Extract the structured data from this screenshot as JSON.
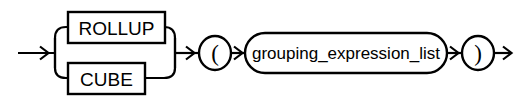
{
  "diagram": {
    "kind": "railroad-syntax-diagram",
    "background_color": "#ffffff",
    "line_color": "#000000",
    "canvas": {
      "width": 525,
      "height": 104
    },
    "entry": {
      "name": "entry-arrow",
      "label": "",
      "x1": 18,
      "y1": 53,
      "x2": 55,
      "y2": 53
    },
    "exit": {
      "name": "exit-arrow",
      "label": "",
      "x1": 492,
      "y1": 53,
      "x2": 512,
      "y2": 53
    },
    "alternation": {
      "name": "rollup-cube-choice",
      "fork_x": 55,
      "merge_x": 175,
      "corner_radius": 11,
      "branches": [
        {
          "id": "rollup",
          "label": "ROLLUP",
          "node_type": "terminal",
          "shape": "rect",
          "x": 68,
          "y": 12,
          "width": 97,
          "height": 31,
          "rail_y": 27
        },
        {
          "id": "cube",
          "label": "CUBE",
          "node_type": "terminal",
          "shape": "rect",
          "x": 68,
          "y": 63,
          "width": 77,
          "height": 31,
          "rail_y": 78
        }
      ]
    },
    "sequence": [
      {
        "id": "open-paren",
        "label": "(",
        "node_type": "punctuation",
        "shape": "circle",
        "cx": 215,
        "cy": 53,
        "rx": 16,
        "ry": 17
      },
      {
        "id": "grouping-expression-list",
        "label": "grouping_expression_list",
        "node_type": "nonterminal",
        "shape": "stadium",
        "x": 245,
        "y": 33,
        "width": 202,
        "height": 40
      },
      {
        "id": "close-paren",
        "label": ")",
        "node_type": "punctuation",
        "shape": "circle",
        "cx": 478,
        "cy": 53,
        "rx": 16,
        "ry": 17
      }
    ],
    "connectors": [
      {
        "id": "merge-to-open-paren",
        "x1": 175,
        "y1": 53,
        "x2": 199,
        "y2": 53
      },
      {
        "id": "open-paren-to-list",
        "x1": 231,
        "y1": 53,
        "x2": 245,
        "y2": 53
      },
      {
        "id": "list-to-close-paren",
        "x1": 447,
        "y1": 53,
        "x2": 462,
        "y2": 53
      }
    ]
  }
}
